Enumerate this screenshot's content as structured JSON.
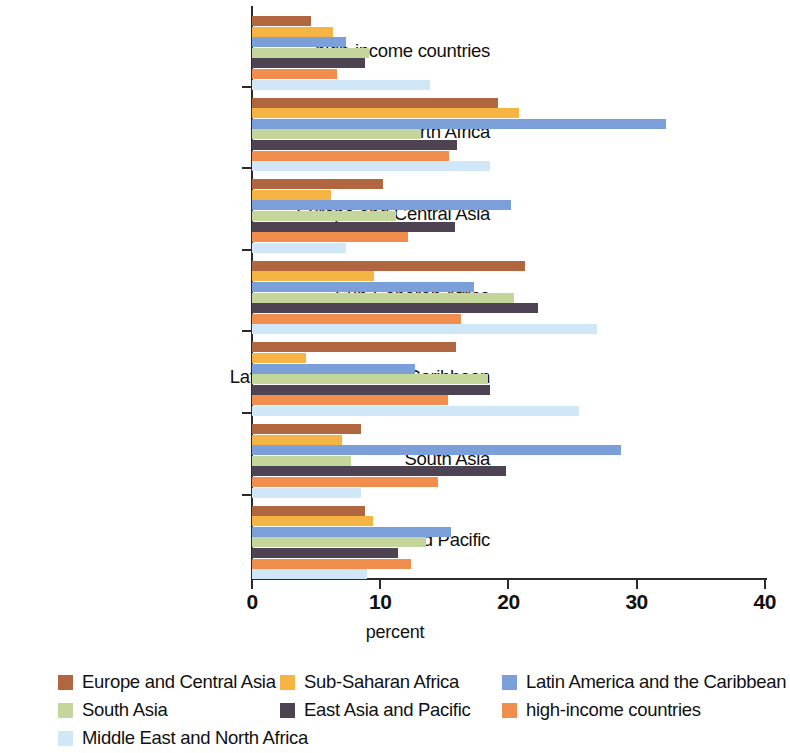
{
  "chart_data": {
    "type": "bar",
    "orientation": "horizontal",
    "title": "",
    "xlabel": "percent",
    "ylabel": "",
    "xlim": [
      0,
      40
    ],
    "xticks": [
      0,
      10,
      20,
      30,
      40
    ],
    "grid": false,
    "legend_position": "bottom",
    "categories": [
      "high-income countries",
      "Middle East and North Africa",
      "Europe and Central Asia",
      "Sub-Saharan Africa",
      "Latin America and the Caribbean",
      "South Asia",
      "East Asia and Pacific"
    ],
    "series": [
      {
        "name": "Europe and Central Asia",
        "color": "#b0663f",
        "values": [
          4.6,
          19.2,
          10.2,
          21.3,
          15.9,
          8.5,
          8.8
        ]
      },
      {
        "name": "Sub-Saharan Africa",
        "color": "#f5b443",
        "values": [
          6.3,
          20.8,
          6.2,
          9.5,
          4.2,
          7.0,
          9.4
        ]
      },
      {
        "name": "Latin America and the Caribbean",
        "color": "#7b9fd8",
        "values": [
          7.3,
          32.3,
          20.2,
          17.3,
          12.7,
          28.8,
          15.5
        ]
      },
      {
        "name": "South Asia",
        "color": "#c4d69b",
        "values": [
          9.1,
          13.2,
          11.2,
          20.4,
          18.4,
          7.7,
          13.6
        ]
      },
      {
        "name": "East Asia and Pacific",
        "color": "#4e4353",
        "values": [
          8.8,
          16.0,
          15.8,
          22.3,
          18.6,
          19.8,
          11.4
        ]
      },
      {
        "name": "high-income countries",
        "color": "#f18e4e",
        "values": [
          6.6,
          15.4,
          12.2,
          16.3,
          15.3,
          14.5,
          12.4
        ]
      },
      {
        "name": "Middle East and North Africa",
        "color": "#cfe7f7",
        "values": [
          13.9,
          18.6,
          7.3,
          26.9,
          25.5,
          8.5,
          9.0
        ]
      }
    ]
  },
  "legend": {
    "items": [
      {
        "label": "Europe and Central Asia",
        "color": "#b0663f"
      },
      {
        "label": "Sub-Saharan Africa",
        "color": "#f5b443"
      },
      {
        "label": "Latin America and the Caribbean",
        "color": "#7b9fd8"
      },
      {
        "label": "South Asia",
        "color": "#c4d69b"
      },
      {
        "label": "East Asia and Pacific",
        "color": "#4e4353"
      },
      {
        "label": "high-income countries",
        "color": "#f18e4e"
      },
      {
        "label": "Middle East and North Africa",
        "color": "#cfe7f7"
      }
    ]
  },
  "axis": {
    "x_title": "percent",
    "tick_labels": [
      "0",
      "10",
      "20",
      "30",
      "40"
    ]
  }
}
